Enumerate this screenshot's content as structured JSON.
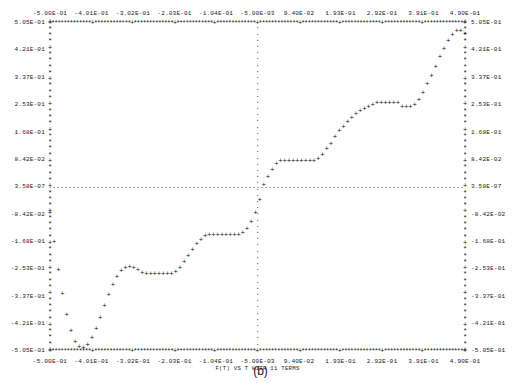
{
  "caption": "(b)",
  "chart_data": {
    "type": "scatter",
    "title": "",
    "xlabel": "F(T) VS T WITH 11 TERMS",
    "ylabel": "",
    "style": "ascii-line-printer",
    "marker": "+",
    "axis_glyph": "*",
    "tick_glyph": "+",
    "grid_glyph": ".",
    "grid": true,
    "gridlines": {
      "horizontal_at_y": 3.58e-07,
      "vertical_at_x": -0.005
    },
    "xlim": [
      -0.5,
      0.49
    ],
    "ylim": [
      -0.505,
      0.505
    ],
    "xticks": [
      -0.5,
      -0.401,
      -0.302,
      -0.203,
      -0.104,
      -0.005,
      0.094,
      0.193,
      0.292,
      0.391,
      0.49
    ],
    "xtick_labels": [
      "-5.00E-01",
      "-4.01E-01",
      "-3.02E-01",
      "-2.03E-01",
      "-1.04E-01",
      "-5.00E-03",
      "9.40E-02",
      "1.93E-01",
      "2.92E-01",
      "3.91E-01",
      "4.90E-01"
    ],
    "yticks": [
      0.505,
      0.421,
      0.337,
      0.253,
      0.168,
      0.0842,
      3.58e-07,
      -0.0842,
      -0.168,
      -0.253,
      -0.337,
      -0.421,
      -0.505
    ],
    "ytick_labels": [
      "5.05E-01",
      "4.21E-01",
      "3.37E-01",
      "2.53E-01",
      "1.68E-01",
      "8.42E-02",
      "3.58E-07",
      "-8.42E-02",
      "-1.68E-01",
      "-2.53E-01",
      "-3.37E-01",
      "-4.21E-01",
      "-5.05E-01"
    ],
    "ytick_labels_right": [
      "5.05E-01",
      "4.21E-01",
      "3.37E-01",
      "2.53E-01",
      "1.68E-01",
      "8.42E-02",
      "3.58E-07",
      "-8.42E-02",
      "-1.68E-01",
      "-2.53E-01",
      "-3.37E-01",
      "-4.21E-01",
      "-5.05E-01"
    ],
    "legend": [],
    "series": [
      {
        "name": "F(T) with 11 terms",
        "x": [
          -0.5,
          -0.49,
          -0.48,
          -0.47,
          -0.46,
          -0.45,
          -0.44,
          -0.43,
          -0.42,
          -0.41,
          -0.4,
          -0.39,
          -0.38,
          -0.37,
          -0.36,
          -0.35,
          -0.34,
          -0.33,
          -0.32,
          -0.31,
          -0.3,
          -0.29,
          -0.28,
          -0.27,
          -0.26,
          -0.25,
          -0.24,
          -0.23,
          -0.22,
          -0.21,
          -0.2,
          -0.19,
          -0.18,
          -0.17,
          -0.16,
          -0.15,
          -0.14,
          -0.13,
          -0.12,
          -0.11,
          -0.1,
          -0.09,
          -0.08,
          -0.07,
          -0.06,
          -0.05,
          -0.04,
          -0.03,
          -0.02,
          -0.01,
          0.0,
          0.01,
          0.02,
          0.03,
          0.04,
          0.05,
          0.06,
          0.07,
          0.08,
          0.09,
          0.1,
          0.11,
          0.12,
          0.13,
          0.14,
          0.15,
          0.16,
          0.17,
          0.18,
          0.19,
          0.2,
          0.21,
          0.22,
          0.23,
          0.24,
          0.25,
          0.26,
          0.27,
          0.28,
          0.29,
          0.3,
          0.31,
          0.32,
          0.33,
          0.34,
          0.35,
          0.36,
          0.37,
          0.38,
          0.39,
          0.4,
          0.41,
          0.42,
          0.43,
          0.44,
          0.45,
          0.46,
          0.47,
          0.48,
          0.49
        ],
        "y": [
          -0.08,
          -0.17,
          -0.255,
          -0.33,
          -0.395,
          -0.445,
          -0.478,
          -0.495,
          -0.497,
          -0.487,
          -0.465,
          -0.437,
          -0.403,
          -0.368,
          -0.333,
          -0.302,
          -0.277,
          -0.259,
          -0.249,
          -0.247,
          -0.25,
          -0.257,
          -0.266,
          -0.27,
          -0.268,
          -0.268,
          -0.268,
          -0.268,
          -0.268,
          -0.268,
          -0.262,
          -0.25,
          -0.233,
          -0.214,
          -0.195,
          -0.177,
          -0.163,
          -0.153,
          -0.148,
          -0.148,
          -0.148,
          -0.148,
          -0.148,
          -0.148,
          -0.148,
          -0.148,
          -0.143,
          -0.13,
          -0.11,
          -0.08,
          -0.04,
          0.005,
          0.03,
          0.05,
          0.07,
          0.08,
          0.08,
          0.08,
          0.08,
          0.08,
          0.08,
          0.08,
          0.08,
          0.08,
          0.085,
          0.098,
          0.115,
          0.133,
          0.152,
          0.17,
          0.185,
          0.2,
          0.213,
          0.225,
          0.232,
          0.238,
          0.245,
          0.253,
          0.258,
          0.258,
          0.258,
          0.258,
          0.258,
          0.258,
          0.245,
          0.245,
          0.245,
          0.252,
          0.268,
          0.29,
          0.315,
          0.34,
          0.37,
          0.398,
          0.425,
          0.45,
          0.468,
          0.478,
          0.48,
          0.47
        ]
      }
    ]
  }
}
